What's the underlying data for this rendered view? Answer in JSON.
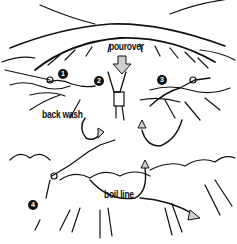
{
  "diagram": {
    "labels": {
      "pourover": "pourover",
      "back_wash": "back wash",
      "boil_line": "boil line"
    },
    "markers": [
      "1",
      "2",
      "3",
      "4"
    ],
    "colors": {
      "ink": "#111111",
      "arrow_fill": "#cfcfcf",
      "background": "#ffffff"
    }
  }
}
